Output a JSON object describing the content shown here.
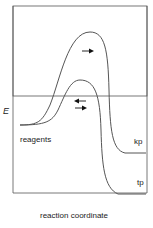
{
  "diagram": {
    "type": "reaction energy profile",
    "y_axis_label": "E",
    "x_axis_label": "reaction coordinate",
    "labels": {
      "reagents": "reagents",
      "kinetic_product": "kp",
      "thermodynamic_product": "tp"
    },
    "curves": [
      {
        "name": "kinetic pathway (higher barrier)",
        "peak": "upper",
        "arrows": [
          "forward"
        ],
        "ends_at": "kp"
      },
      {
        "name": "thermodynamic pathway (lower barrier)",
        "peak": "lower",
        "arrows": [
          "reverse",
          "forward"
        ],
        "ends_at": "tp"
      }
    ],
    "colors": {
      "line": "#555555",
      "frame": "#555555",
      "text": "#222222"
    }
  }
}
